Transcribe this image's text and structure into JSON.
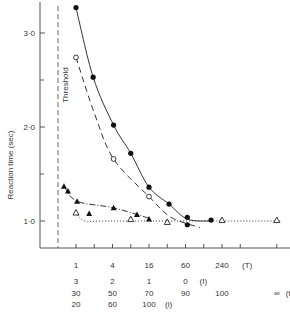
{
  "chart_data": {
    "type": "line",
    "title": "",
    "ylabel": "Reaction time (sec)",
    "xlabel": "",
    "ylim": [
      0.5,
      3.3
    ],
    "yticks": [
      {
        "value": 1.0,
        "label": "1·0"
      },
      {
        "value": 2.0,
        "label": "2·0"
      },
      {
        "value": 3.0,
        "label": "3·0"
      }
    ],
    "yminor": [
      1.5,
      2.5
    ],
    "grid": false,
    "threshold_label": "Threshold",
    "x_scale_rows": [
      {
        "name": "T",
        "labels": [
          "1",
          "4",
          "16",
          "60",
          "240"
        ],
        "positions": [
          1,
          2,
          3,
          4,
          5
        ],
        "suffix": "(T)"
      },
      {
        "name": "I",
        "labels": [
          "3",
          "2",
          "1",
          "0"
        ],
        "positions": [
          1,
          2,
          3,
          4
        ],
        "suffix": "(I)"
      },
      {
        "name": "t",
        "labels": [
          "30",
          "50",
          "70",
          "90",
          "100",
          "∞"
        ],
        "positions": [
          1,
          2,
          3,
          4,
          5,
          6.5
        ],
        "suffix": "(t)"
      },
      {
        "name": "i",
        "labels": [
          "20",
          "60",
          "100"
        ],
        "positions": [
          1,
          2,
          3
        ],
        "suffix": "(i)"
      }
    ],
    "series": [
      {
        "name": "filled-circles",
        "marker": "filled-circle",
        "line": "solid",
        "x": [
          1.0,
          1.47,
          2.03,
          2.5,
          3.0,
          3.55,
          4.05,
          4.05,
          4.7
        ],
        "y": [
          3.27,
          2.53,
          2.02,
          1.72,
          1.36,
          1.18,
          1.04,
          0.96,
          1.01
        ]
      },
      {
        "name": "open-circles",
        "marker": "open-circle",
        "line": "dashed",
        "x": [
          1.0,
          2.03,
          3.0
        ],
        "y": [
          2.74,
          1.66,
          1.26
        ]
      },
      {
        "name": "filled-triangles",
        "marker": "filled-triangle",
        "line": "dash-dot",
        "x": [
          0.67,
          0.78,
          1.03,
          1.36,
          2.03,
          2.67,
          3.0
        ],
        "y": [
          1.37,
          1.32,
          1.21,
          1.08,
          1.14,
          1.07,
          1.02
        ]
      },
      {
        "name": "open-triangles",
        "marker": "open-triangle",
        "line": "dotted",
        "x": [
          1.0,
          2.5,
          3.5,
          5.0,
          6.5
        ],
        "y": [
          1.09,
          1.02,
          0.99,
          1.01,
          1.01
        ]
      }
    ]
  }
}
